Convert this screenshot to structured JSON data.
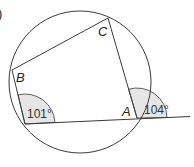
{
  "diagram": {
    "part_label": ")",
    "vertices": {
      "A": "A",
      "B": "B",
      "C": "C"
    },
    "angles": {
      "interior_bottom_left": "101°",
      "exterior_at_A": "104°"
    },
    "colors": {
      "line": "#3a3a3a",
      "sector_fill": "#e6e6e6",
      "background": "#ffffff"
    }
  }
}
